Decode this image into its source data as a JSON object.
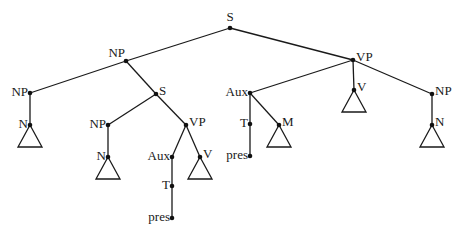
{
  "diagram": {
    "type": "syntax-tree",
    "nodes": [
      {
        "id": "s_root",
        "label": "S",
        "x": 230,
        "y": 28,
        "pos": "top"
      },
      {
        "id": "np_subj",
        "label": "NP",
        "x": 126,
        "y": 61,
        "pos": "left-top"
      },
      {
        "id": "np_left",
        "label": "NP",
        "x": 30,
        "y": 93,
        "pos": "left"
      },
      {
        "id": "n_left",
        "label": "N",
        "x": 30,
        "y": 125,
        "pos": "left",
        "triangle": true
      },
      {
        "id": "s_rel",
        "label": "S",
        "x": 156,
        "y": 94,
        "pos": "right"
      },
      {
        "id": "np_rel",
        "label": "NP",
        "x": 108,
        "y": 125,
        "pos": "left"
      },
      {
        "id": "n_rel",
        "label": "N",
        "x": 108,
        "y": 157,
        "pos": "left",
        "triangle": true
      },
      {
        "id": "vp_rel",
        "label": "VP",
        "x": 186,
        "y": 125,
        "pos": "right"
      },
      {
        "id": "aux_rel",
        "label": "Aux",
        "x": 172,
        "y": 157,
        "pos": "left"
      },
      {
        "id": "t_rel",
        "label": "T",
        "x": 172,
        "y": 186,
        "pos": "left"
      },
      {
        "id": "pres_rel",
        "label": "pres",
        "x": 172,
        "y": 218,
        "pos": "left"
      },
      {
        "id": "v_rel",
        "label": "V",
        "x": 200,
        "y": 157,
        "pos": "right",
        "triangle": true
      },
      {
        "id": "vp_main",
        "label": "VP",
        "x": 353,
        "y": 60,
        "pos": "right"
      },
      {
        "id": "aux_main",
        "label": "Aux",
        "x": 250,
        "y": 93,
        "pos": "left"
      },
      {
        "id": "t_main",
        "label": "T",
        "x": 250,
        "y": 124,
        "pos": "left"
      },
      {
        "id": "pres_main",
        "label": "pres",
        "x": 250,
        "y": 156,
        "pos": "left"
      },
      {
        "id": "m_main",
        "label": "M",
        "x": 279,
        "y": 125,
        "pos": "right",
        "triangle": true
      },
      {
        "id": "v_main",
        "label": "V",
        "x": 354,
        "y": 90,
        "pos": "right",
        "triangle": true
      },
      {
        "id": "np_obj",
        "label": "NP",
        "x": 432,
        "y": 94,
        "pos": "right"
      },
      {
        "id": "n_obj",
        "label": "N",
        "x": 432,
        "y": 125,
        "pos": "right",
        "triangle": true
      }
    ],
    "edges": [
      [
        "s_root",
        "np_subj"
      ],
      [
        "s_root",
        "vp_main"
      ],
      [
        "np_subj",
        "np_left"
      ],
      [
        "np_subj",
        "s_rel"
      ],
      [
        "np_left",
        "n_left"
      ],
      [
        "s_rel",
        "np_rel"
      ],
      [
        "s_rel",
        "vp_rel"
      ],
      [
        "np_rel",
        "n_rel"
      ],
      [
        "vp_rel",
        "aux_rel"
      ],
      [
        "vp_rel",
        "v_rel"
      ],
      [
        "aux_rel",
        "t_rel"
      ],
      [
        "t_rel",
        "pres_rel"
      ],
      [
        "vp_main",
        "aux_main"
      ],
      [
        "vp_main",
        "v_main"
      ],
      [
        "vp_main",
        "np_obj"
      ],
      [
        "aux_main",
        "t_main"
      ],
      [
        "t_main",
        "pres_main"
      ],
      [
        "aux_main",
        "m_main"
      ],
      [
        "np_obj",
        "n_obj"
      ]
    ]
  }
}
